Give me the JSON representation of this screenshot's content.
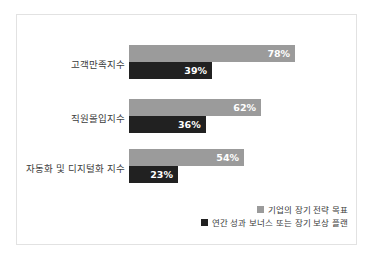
{
  "chart_data": {
    "type": "bar",
    "orientation": "horizontal",
    "title": "",
    "xlabel": "",
    "ylabel": "",
    "xlim": [
      0,
      100
    ],
    "grid": false,
    "legend_position": "bottom-right",
    "value_suffix": "%",
    "categories": [
      "고객만족지수",
      "직원몰입지수",
      "자동화 및 디지털화 지수"
    ],
    "series": [
      {
        "name": "기업의 장기 전략 목표",
        "color": "#9b9b9b",
        "values": [
          78,
          62,
          54
        ],
        "labels": [
          "78%",
          "62%",
          "54%"
        ]
      },
      {
        "name": "연간 성과 보너스 또는 장기 보상 플랜",
        "color": "#212121",
        "values": [
          39,
          36,
          23
        ],
        "labels": [
          "39%",
          "36%",
          "23%"
        ]
      }
    ]
  },
  "card": {
    "border_color": "#e2e2e2",
    "background": "#ffffff"
  }
}
